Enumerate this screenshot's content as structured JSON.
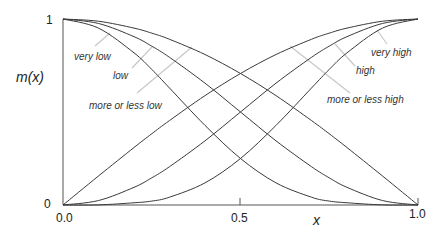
{
  "chart_data": {
    "type": "line",
    "title": "",
    "xlabel": "x",
    "ylabel": "m(x)",
    "xlim": [
      0,
      1
    ],
    "ylim": [
      0,
      1
    ],
    "grid": false,
    "legend": "inline labels with gray leader lines",
    "x_ticks": [
      {
        "value": 0,
        "label": "0.0"
      },
      {
        "value": 0.5,
        "label": "0.5"
      },
      {
        "value": 1,
        "label": "1.0"
      }
    ],
    "y_ticks": [
      {
        "value": 0,
        "label": "0"
      },
      {
        "value": 1,
        "label": "1"
      }
    ],
    "x": [
      0,
      0.1,
      0.2,
      0.25,
      0.3,
      0.4,
      0.5,
      0.6,
      0.7,
      0.75,
      0.8,
      0.9,
      1.0
    ],
    "series": [
      {
        "name": "very low",
        "values": [
          1.0,
          0.951,
          0.818,
          0.729,
          0.629,
          0.428,
          0.25,
          0.119,
          0.042,
          0.021,
          0.012,
          0.0006,
          0.0
        ]
      },
      {
        "name": "low",
        "values": [
          1.0,
          0.976,
          0.905,
          0.854,
          0.794,
          0.655,
          0.5,
          0.345,
          0.206,
          0.146,
          0.095,
          0.024,
          0.0
        ]
      },
      {
        "name": "more or less low",
        "values": [
          1.0,
          0.988,
          0.951,
          0.924,
          0.891,
          0.809,
          0.707,
          0.588,
          0.454,
          0.383,
          0.309,
          0.156,
          0.0
        ]
      },
      {
        "name": "very high",
        "values": [
          0.0,
          0.0006,
          0.012,
          0.021,
          0.042,
          0.119,
          0.25,
          0.428,
          0.629,
          0.729,
          0.818,
          0.951,
          1.0
        ]
      },
      {
        "name": "high",
        "values": [
          0.0,
          0.024,
          0.095,
          0.146,
          0.206,
          0.345,
          0.5,
          0.655,
          0.794,
          0.854,
          0.905,
          0.976,
          1.0
        ]
      },
      {
        "name": "more or less high",
        "values": [
          0.0,
          0.156,
          0.309,
          0.383,
          0.454,
          0.588,
          0.707,
          0.809,
          0.891,
          0.924,
          0.951,
          0.988,
          1.0
        ]
      }
    ],
    "annotations": [
      {
        "text": "very low",
        "series": "very low"
      },
      {
        "text": "low",
        "series": "low"
      },
      {
        "text": "more or less low",
        "series": "more or less low"
      },
      {
        "text": "very high",
        "series": "very high"
      },
      {
        "text": "high",
        "series": "high"
      },
      {
        "text": "more or less high",
        "series": "more or less high"
      }
    ]
  },
  "labels": {
    "y_axis": "m(x)",
    "x_axis": "x",
    "y_top": "1",
    "y_bottom": "0",
    "x_left": "0.0",
    "x_mid": "0.5",
    "x_right": "1.0",
    "very_low": "very low",
    "low": "low",
    "more_or_less_low": "more or less low",
    "very_high": "very high",
    "high": "high",
    "more_or_less_high": "more or less high"
  }
}
